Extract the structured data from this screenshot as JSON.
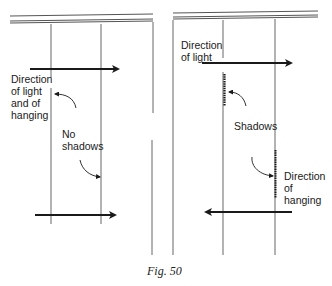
{
  "figure": {
    "caption": "Fig. 50",
    "panels": [
      {
        "id": "left",
        "description": "Light and hanging in same direction",
        "labels": {
          "direction": "Direction\nof light\nand of\nhanging",
          "shadow": "No\nshadows"
        },
        "arrows": [
          {
            "name": "light-arrow",
            "direction": "right"
          },
          {
            "name": "hanging-arrow",
            "direction": "right"
          }
        ]
      },
      {
        "id": "right",
        "description": "Light and hanging in opposite directions",
        "labels": {
          "light": "Direction\nof light",
          "shadow": "Shadows",
          "hanging": "Direction\nof\nhanging"
        },
        "arrows": [
          {
            "name": "light-arrow",
            "direction": "right"
          },
          {
            "name": "hanging-arrow",
            "direction": "left"
          }
        ]
      }
    ]
  },
  "colors": {
    "ink": "#1a1a1a",
    "line": "#555555",
    "background": "#ffffff"
  }
}
